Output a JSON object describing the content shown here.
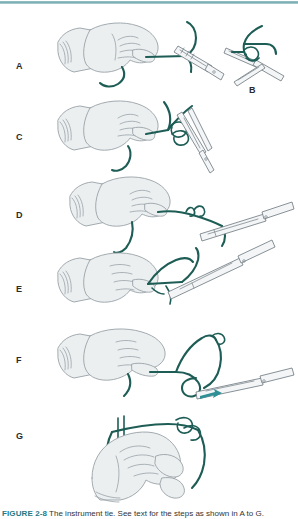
{
  "figure": {
    "panel_labels": [
      "A",
      "B",
      "C",
      "D",
      "E",
      "F",
      "G"
    ],
    "caption_label": "FIGURE 2-8",
    "caption_text": "The instrument tie. See text for the steps as shown in A to G.",
    "colors": {
      "rule_teal": "#79adb3",
      "suture_green": "#1d5d55",
      "skin_fill": "#eceff0",
      "skin_outline": "#9aa3a8",
      "instrument_fill": "#f4f5f6",
      "instrument_outline": "#7f8a90",
      "arrow_teal": "#2e8f96",
      "label_color": "#2b2b2b",
      "caption_label_color": "#1f7a86"
    },
    "panels": [
      {
        "id": "A",
        "label": "A",
        "x": 16,
        "y": 68,
        "content": "hand-holding-suture-with-needle-holder"
      },
      {
        "id": "B",
        "label": "B",
        "x": 251,
        "y": 92,
        "content": "close-up-loop-over-needle-holder-jaws"
      },
      {
        "id": "C",
        "label": "C",
        "x": 16,
        "y": 139,
        "content": "double-wrap-around-needle-holder"
      },
      {
        "id": "D",
        "label": "D",
        "x": 16,
        "y": 217,
        "content": "grasping-short-end-and-pulling-through"
      },
      {
        "id": "E",
        "label": "E",
        "x": 16,
        "y": 291,
        "content": "tightening-first-throw"
      },
      {
        "id": "F",
        "label": "F",
        "x": 16,
        "y": 362,
        "content": "second-throw-opposite-direction"
      },
      {
        "id": "G",
        "label": "G",
        "x": 16,
        "y": 438,
        "content": "completed-square-knot"
      }
    ]
  }
}
